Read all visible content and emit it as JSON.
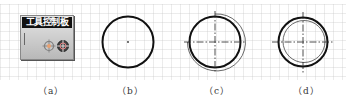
{
  "toolbar": {
    "title": "工具控制板",
    "tools": [
      {
        "name": "offset-tool-icon"
      },
      {
        "name": "fit-tool-icon"
      }
    ]
  },
  "figures": [
    {
      "id": "a",
      "caption": "（a）"
    },
    {
      "id": "b",
      "caption": "（b）"
    },
    {
      "id": "c",
      "caption": "（c）"
    },
    {
      "id": "d",
      "caption": "（d）"
    }
  ],
  "colors": {
    "stroke": "#111111",
    "grid": "#d0d0d0",
    "panel_title_bg": "#111111",
    "panel_bg": "#c8c8c8"
  }
}
